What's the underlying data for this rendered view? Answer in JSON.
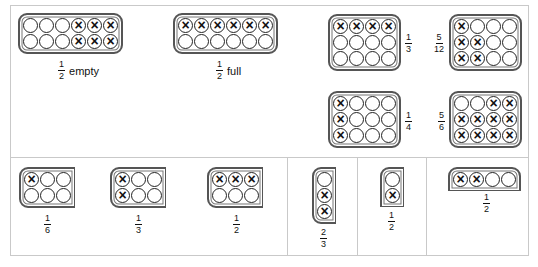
{
  "top_panel": {
    "trays": [
      {
        "id": "half-empty",
        "rows": 2,
        "cols": 6,
        "filled": [
          [
            0,
            0,
            0,
            1,
            1,
            1
          ],
          [
            0,
            0,
            0,
            1,
            1,
            1
          ]
        ],
        "fraction": {
          "num": "1",
          "den": "2"
        },
        "caption": "empty"
      },
      {
        "id": "half-full",
        "rows": 2,
        "cols": 6,
        "filled": [
          [
            1,
            1,
            1,
            1,
            1,
            1
          ],
          [
            0,
            0,
            0,
            0,
            0,
            0
          ]
        ],
        "fraction": {
          "num": "1",
          "den": "2"
        },
        "caption": "full"
      },
      {
        "id": "one-third",
        "rows": 3,
        "cols": 4,
        "filled": [
          [
            1,
            1,
            1,
            1
          ],
          [
            0,
            0,
            0,
            0
          ],
          [
            0,
            0,
            0,
            0
          ]
        ],
        "fraction": {
          "num": "1",
          "den": "3"
        }
      },
      {
        "id": "five-twelfths",
        "rows": 3,
        "cols": 4,
        "filled": [
          [
            1,
            0,
            0,
            0
          ],
          [
            1,
            1,
            0,
            0
          ],
          [
            1,
            1,
            0,
            0
          ]
        ],
        "fraction": {
          "num": "5",
          "den": "12"
        }
      },
      {
        "id": "one-quarter",
        "rows": 3,
        "cols": 4,
        "filled": [
          [
            1,
            0,
            0,
            0
          ],
          [
            1,
            0,
            0,
            0
          ],
          [
            1,
            0,
            0,
            0
          ]
        ],
        "fraction": {
          "num": "1",
          "den": "4"
        }
      },
      {
        "id": "five-sixths",
        "rows": 3,
        "cols": 4,
        "filled": [
          [
            0,
            0,
            1,
            1
          ],
          [
            1,
            1,
            1,
            1
          ],
          [
            1,
            1,
            1,
            1
          ]
        ],
        "fraction": {
          "num": "5",
          "den": "6"
        }
      }
    ]
  },
  "bottom_panel": {
    "trays": [
      {
        "id": "one-sixth",
        "rows": 2,
        "cols": 3,
        "filled": [
          [
            1,
            0,
            0
          ],
          [
            0,
            0,
            0
          ]
        ],
        "fraction": {
          "num": "1",
          "den": "6"
        }
      },
      {
        "id": "one-third-b",
        "rows": 2,
        "cols": 3,
        "filled": [
          [
            1,
            0,
            0
          ],
          [
            1,
            0,
            0
          ]
        ],
        "fraction": {
          "num": "1",
          "den": "3"
        }
      },
      {
        "id": "one-half-b",
        "rows": 2,
        "cols": 3,
        "filled": [
          [
            1,
            1,
            1
          ],
          [
            0,
            0,
            0
          ]
        ],
        "fraction": {
          "num": "1",
          "den": "2"
        }
      },
      {
        "id": "two-thirds",
        "rows": 3,
        "cols": 1,
        "filled": [
          [
            0
          ],
          [
            1
          ],
          [
            1
          ]
        ],
        "fraction": {
          "num": "2",
          "den": "3"
        }
      },
      {
        "id": "one-half-c",
        "rows": 2,
        "cols": 1,
        "filled": [
          [
            0
          ],
          [
            1
          ]
        ],
        "fraction": {
          "num": "1",
          "den": "2"
        }
      },
      {
        "id": "one-half-d",
        "rows": 1,
        "cols": 4,
        "filled": [
          [
            1,
            1,
            0,
            0
          ]
        ],
        "fraction": {
          "num": "1",
          "den": "2"
        }
      }
    ]
  },
  "colors": {
    "border": "#c9c9c9",
    "tray": "#555555",
    "mark": "#111111"
  }
}
